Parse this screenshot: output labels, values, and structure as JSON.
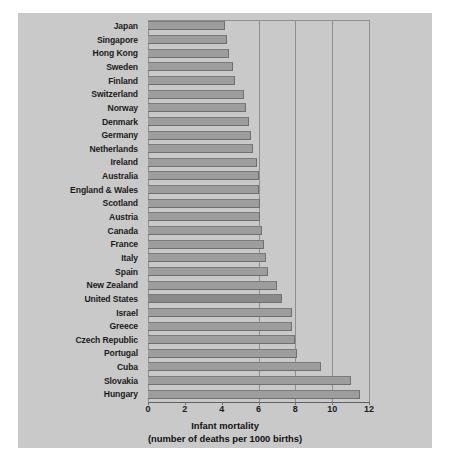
{
  "chart_data": {
    "type": "bar",
    "orientation": "horizontal",
    "title": "",
    "xlabel": "Infant mortality",
    "xlabel_line2": "(number of deaths per 1000 births)",
    "ylabel": "",
    "xlim": [
      0,
      12
    ],
    "xticks": [
      0,
      2,
      4,
      6,
      8,
      10,
      12
    ],
    "xtick_labels": [
      "0",
      "2",
      "4",
      "6",
      "8",
      "10",
      "12"
    ],
    "gridlines_at": [
      6,
      8,
      10,
      12
    ],
    "grid": true,
    "legend": null,
    "categories": [
      "Japan",
      "Singapore",
      "Hong Kong",
      "Sweden",
      "Finland",
      "Switzerland",
      "Norway",
      "Denmark",
      "Germany",
      "Netherlands",
      "Ireland",
      "Australia",
      "England & Wales",
      "Scotland",
      "Austria",
      "Canada",
      "France",
      "Italy",
      "Spain",
      "New Zealand",
      "United States",
      "Israel",
      "Greece",
      "Czech Republic",
      "Portugal",
      "Cuba",
      "Slovakia",
      "Hungary"
    ],
    "values": [
      4.2,
      4.3,
      4.4,
      4.6,
      4.7,
      5.2,
      5.3,
      5.5,
      5.6,
      5.7,
      5.9,
      6.0,
      6.0,
      6.1,
      6.1,
      6.2,
      6.3,
      6.4,
      6.5,
      7.0,
      7.3,
      7.8,
      7.8,
      8.0,
      8.1,
      9.4,
      11.0,
      11.5
    ],
    "highlight_category": "United States",
    "bar_color": "#9d9d9d",
    "highlight_color": "#8a8a8a",
    "background_color": "#c9c9c9",
    "grid_color": "#8f8f8f"
  }
}
